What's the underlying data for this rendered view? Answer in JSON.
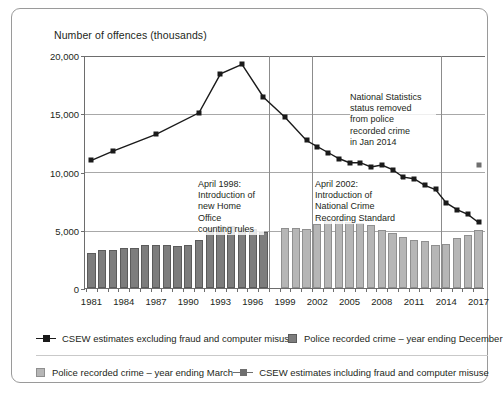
{
  "chart": {
    "title": "Number of offences (thousands)",
    "ylabel": "Number of offences (thousands)",
    "xlabel": ""
  },
  "axes": {
    "y_ticks": [
      "0",
      "5,000",
      "10,000",
      "15,000",
      "20,000"
    ],
    "x_ticks": [
      "1981",
      "1984",
      "1987",
      "1990",
      "1993",
      "1996",
      "1999",
      "2002",
      "2005",
      "2008",
      "2011",
      "2014",
      "2017"
    ]
  },
  "annotations": [
    {
      "id": "ann-1998",
      "text": "April 1998:\nIntroduction of\nnew Home Office\ncounting rules"
    },
    {
      "id": "ann-2002",
      "text": "April 2002:\nIntroduction of\nNational Crime\nRecording Standard"
    },
    {
      "id": "ann-2014",
      "text": "National Statistics\nstatus removed\nfrom police\nrecorded crime\nin Jan 2014"
    }
  ],
  "legend": {
    "items": [
      {
        "label": "CSEW estimates excluding fraud and computer misuse",
        "marker": "line-dark"
      },
      {
        "label": "Police recorded crime – year ending December",
        "marker": "square-dark"
      },
      {
        "label": "Police recorded crime – year ending March",
        "marker": "square-light"
      },
      {
        "label": "CSEW estimates including fraud and computer misuse",
        "marker": "line-grey"
      }
    ]
  },
  "chart_data": {
    "type": "bar",
    "title": "Number of offences (thousands)",
    "xlabel": "",
    "ylabel": "Number of offences (thousands)",
    "ylim": [
      0,
      20000
    ],
    "xlim": [
      1980.4,
      2017.6
    ],
    "grid": true,
    "legend_position": "bottom",
    "x": [
      1981,
      1982,
      1983,
      1984,
      1985,
      1986,
      1987,
      1988,
      1989,
      1990,
      1991,
      1992,
      1993,
      1994,
      1995,
      1996,
      1997,
      1998,
      1999,
      2000,
      2001,
      2002,
      2003,
      2004,
      2005,
      2006,
      2007,
      2008,
      2009,
      2010,
      2011,
      2012,
      2013,
      2014,
      2015,
      2016,
      2017
    ],
    "series": [
      {
        "name": "Police recorded crime – year ending December",
        "type": "bar",
        "color": "#7d7d7d",
        "x": [
          1981,
          1982,
          1983,
          1984,
          1985,
          1986,
          1987,
          1988,
          1989,
          1990,
          1991,
          1992,
          1993,
          1994,
          1995,
          1996,
          1997
        ],
        "values": [
          2964,
          3262,
          3247,
          3426,
          3457,
          3722,
          3723,
          3716,
          3612,
          3724,
          4156,
          5121,
          5331,
          5338,
          5165,
          5036,
          4776
        ]
      },
      {
        "name": "Police recorded crime – year ending March",
        "type": "bar",
        "color": "#b6b6b6",
        "x": [
          1999,
          2000,
          2001,
          2002,
          2003,
          2004,
          2005,
          2006,
          2007,
          2008,
          2009,
          2010,
          2011,
          2012,
          2013,
          2014,
          2015,
          2016,
          2017
        ],
        "values": [
          5109,
          5171,
          5075,
          5525,
          5899,
          5935,
          5637,
          5556,
          5428,
          4951,
          4703,
          4338,
          4150,
          4034,
          3731,
          3797,
          4310,
          4532,
          5001
        ]
      },
      {
        "name": "CSEW estimates excluding fraud and computer misuse",
        "type": "line",
        "color": "#1a1a1a",
        "x": [
          1981,
          1983,
          1987,
          1991,
          1993,
          1995,
          1997,
          1999,
          2001,
          2002,
          2003,
          2004,
          2005,
          2006,
          2007,
          2008,
          2009,
          2010,
          2011,
          2012,
          2013,
          2014,
          2015,
          2016,
          2017
        ],
        "values": [
          11049,
          11838,
          13271,
          15124,
          18462,
          19279,
          16465,
          14741,
          12747,
          12213,
          11715,
          11201,
          10840,
          10845,
          10473,
          10633,
          10240,
          9594,
          9469,
          8892,
          8545,
          7390,
          6813,
          6404,
          5710
        ]
      },
      {
        "name": "CSEW estimates including fraud and computer misuse",
        "type": "scatter",
        "color": "#6f6f6f",
        "x": [
          2017
        ],
        "values": [
          10616
        ]
      }
    ],
    "reference_lines": [
      {
        "x": 1998,
        "label": "April 1998: Introduction of new Home Office counting rules"
      },
      {
        "x": 2002,
        "label": "April 2002: Introduction of National Crime Recording Standard"
      },
      {
        "x": 2014,
        "label": "National Statistics status removed from police recorded crime in Jan 2014"
      }
    ]
  }
}
